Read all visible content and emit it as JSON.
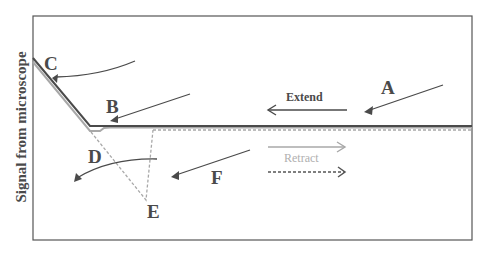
{
  "diagram": {
    "type": "afm-force-curve",
    "y_axis_label": "Signal from microscope",
    "point_labels": {
      "A": "A",
      "B": "B",
      "C": "C",
      "D": "D",
      "E": "E",
      "F": "F"
    },
    "legend": {
      "extend_label": "Extend",
      "retract_label": "Retract"
    },
    "colors": {
      "extend_line": "#4a4a4a",
      "retract_line": "#a8a8a8",
      "frame": "#555555",
      "label_text": "#4a4a4a",
      "retract_text": "#b0b0b0"
    }
  }
}
